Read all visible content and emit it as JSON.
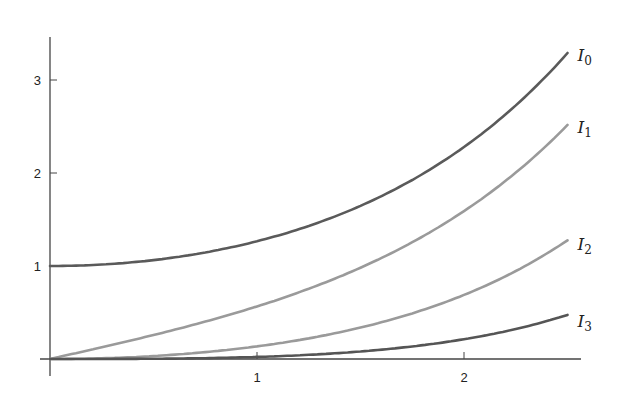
{
  "chart_data": {
    "type": "line",
    "title": "",
    "xlabel": "",
    "ylabel": "",
    "xlim": [
      0,
      2.5
    ],
    "ylim": [
      0,
      3.4
    ],
    "grid": false,
    "legend_position": "inline-right-end-labels",
    "x_ticks": [
      1,
      2
    ],
    "x_tick_labels": [
      "1",
      "2"
    ],
    "y_ticks": [
      1,
      2,
      3
    ],
    "y_tick_labels": [
      "1",
      "2",
      "3"
    ],
    "x": [
      0,
      0.25,
      0.5,
      0.75,
      1.0,
      1.25,
      1.5,
      1.75,
      2.0,
      2.25,
      2.5
    ],
    "series": [
      {
        "name": "I0",
        "label_main": "I",
        "label_sub": "0",
        "color": "#5a5a5a",
        "values": [
          1.0,
          1.016,
          1.063,
          1.146,
          1.266,
          1.429,
          1.647,
          1.928,
          2.28,
          2.718,
          3.29
        ]
      },
      {
        "name": "I1",
        "label_main": "I",
        "label_sub": "1",
        "color": "#9a9a9a",
        "values": [
          0.0,
          0.126,
          0.258,
          0.401,
          0.565,
          0.756,
          0.982,
          1.258,
          1.591,
          1.995,
          2.517
        ]
      },
      {
        "name": "I2",
        "label_main": "I",
        "label_sub": "2",
        "color": "#9a9a9a",
        "values": [
          0.0,
          0.008,
          0.032,
          0.073,
          0.136,
          0.224,
          0.338,
          0.49,
          0.689,
          0.946,
          1.276
        ]
      },
      {
        "name": "I3",
        "label_main": "I",
        "label_sub": "3",
        "color": "#555555",
        "values": [
          0.0,
          0.0003,
          0.003,
          0.009,
          0.022,
          0.045,
          0.081,
          0.133,
          0.213,
          0.323,
          0.474
        ]
      }
    ]
  }
}
